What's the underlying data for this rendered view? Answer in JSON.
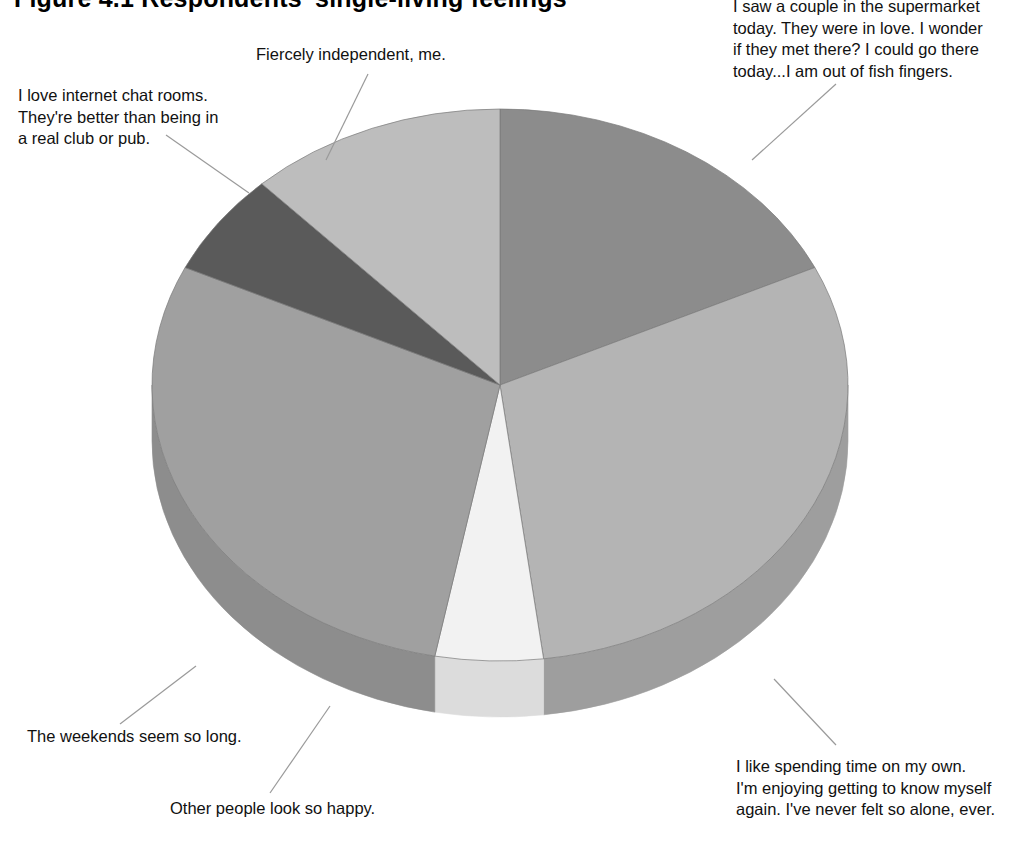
{
  "title": "Figure 4.1  Respondents' single-living feelings",
  "chart_data": {
    "type": "pie",
    "title": "Figure 4.1  Respondents' single-living feelings",
    "style": "3d-pie",
    "legend": "callout-labels",
    "grid": false,
    "categories": [
      "I saw a couple in the supermarket today. They were in love. I wonder if they met there? I could go there today...I am out of fish fingers.",
      "I like spending time on my own. I'm enjoying getting to know myself again. I've never felt so alone, ever.",
      "Other people look so happy.",
      "The weekends seem so long.",
      "I love internet chat rooms. They're better than being in a real club or pub.",
      "Fiercely independent, me."
    ],
    "values": [
      18,
      30,
      5,
      29,
      6,
      12
    ],
    "start_angle_deg": -90,
    "colors": [
      "#8c8c8c",
      "#b4b4b4",
      "#f2f2f2",
      "#a0a0a0",
      "#5a5a5a",
      "#bdbdbd"
    ],
    "xlabel": "",
    "ylabel": ""
  },
  "slices": [
    {
      "name": "supermarket",
      "label": "I saw a couple in the supermarket\ntoday. They were in love. I wonder\nif they met there? I could go there\ntoday...I am out of fish fingers.",
      "value": 18,
      "color": "#8c8c8c",
      "side_color": "#7d7d7d"
    },
    {
      "name": "own-time",
      "label": "I like spending time on my own.\nI'm enjoying getting to know myself\nagain. I've never felt so alone, ever.",
      "value": 30,
      "color": "#b4b4b4",
      "side_color": "#9e9e9e"
    },
    {
      "name": "other-people-happy",
      "label": "Other people look so happy.",
      "value": 5,
      "color": "#f2f2f2",
      "side_color": "#dcdcdc"
    },
    {
      "name": "weekends",
      "label": "The weekends seem so long.",
      "value": 29,
      "color": "#a0a0a0",
      "side_color": "#8d8d8d"
    },
    {
      "name": "chat-rooms",
      "label": "I love internet chat rooms.\nThey're better than being in\na real club or pub.",
      "value": 6,
      "color": "#5a5a5a",
      "side_color": "#4e4e4e"
    },
    {
      "name": "independent",
      "label": "Fiercely independent, me.",
      "value": 12,
      "color": "#bdbdbd",
      "side_color": "#a8a8a8"
    }
  ],
  "leader_line_color": "#9a9a9a"
}
